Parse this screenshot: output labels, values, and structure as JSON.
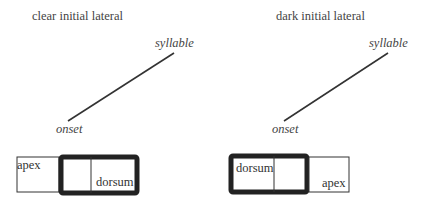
{
  "panels": [
    {
      "title": "clear initial lateral",
      "upper_node": "syllable",
      "lower_node": "onset",
      "boxes": {
        "thin_label": "apex",
        "thick_label": "dorsum"
      }
    },
    {
      "title": "dark initial lateral",
      "upper_node": "syllable",
      "lower_node": "onset",
      "boxes": {
        "thin_label": "apex",
        "thick_label": "dorsum"
      }
    }
  ]
}
